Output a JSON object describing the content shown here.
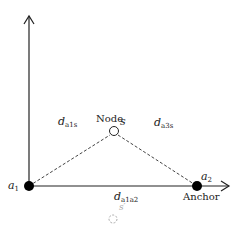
{
  "diagram": {
    "labels": {
      "node": "Node",
      "anchor": "Anchor",
      "s": "s",
      "s_prime": "s′",
      "a1_base": "a",
      "a1_sub": "1",
      "a2_base": "a",
      "a2_sub": "2",
      "d_a1s_base": "d",
      "d_a1s_sub": "a1s",
      "d_a3s_base": "d",
      "d_a3s_sub": "a3s",
      "d_a1a2_base": "d",
      "d_a1a2_sub": "a1a2"
    },
    "colors": {
      "stroke": "#222222",
      "dashed": "#444444",
      "faint": "#aaaaaa"
    }
  }
}
